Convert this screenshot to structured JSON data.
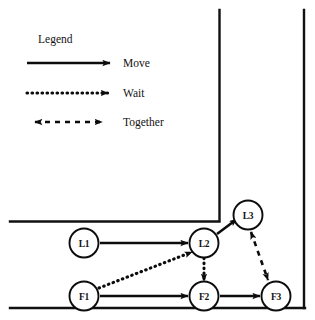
{
  "figure": {
    "legend": {
      "title": "Legend",
      "items": [
        {
          "label": "Move",
          "style": "solid-arrow",
          "name": "legend-move"
        },
        {
          "label": "Wait",
          "style": "dotted-arrow",
          "name": "legend-wait"
        },
        {
          "label": "Together",
          "style": "dashed-double-arrow",
          "name": "legend-together"
        }
      ]
    },
    "nodes": [
      {
        "id": "L1",
        "label": "L1",
        "cx": 84,
        "cy": 243
      },
      {
        "id": "L2",
        "label": "L2",
        "cx": 204,
        "cy": 243
      },
      {
        "id": "L3",
        "label": "L3",
        "cx": 248,
        "cy": 215
      },
      {
        "id": "F1",
        "label": "F1",
        "cx": 84,
        "cy": 296
      },
      {
        "id": "F2",
        "label": "F2",
        "cx": 204,
        "cy": 296
      },
      {
        "id": "F3",
        "label": "F3",
        "cx": 276,
        "cy": 296
      }
    ],
    "edges": [
      {
        "from": "L1",
        "to": "L2",
        "type": "Move",
        "style": "solid-arrow"
      },
      {
        "from": "F1",
        "to": "F2",
        "type": "Move",
        "style": "solid-arrow"
      },
      {
        "from": "F2",
        "to": "F3",
        "type": "Move",
        "style": "solid-arrow"
      },
      {
        "from": "L2",
        "to": "L3",
        "type": "Move",
        "style": "solid-arrow"
      },
      {
        "from": "F1",
        "to": "L2",
        "type": "Wait",
        "style": "dotted-arrow"
      },
      {
        "from": "L2",
        "to": "F2",
        "type": "Wait",
        "style": "dotted-arrow"
      },
      {
        "from": "L3",
        "to": "F3",
        "type": "Together",
        "style": "dashed-double-arrow"
      }
    ],
    "colors": {
      "ink": "#111111",
      "background": "#ffffff"
    }
  }
}
